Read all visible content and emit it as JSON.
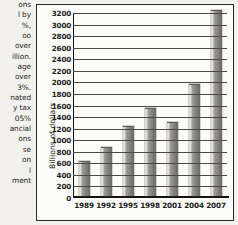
{
  "page": {
    "text_column": [
      "ons",
      "l by",
      "%,",
      "oo",
      "over",
      "illion.",
      "age",
      "over",
      "3%.",
      "nated",
      "y tax",
      "05%",
      "ancial",
      "ons",
      "se",
      "on",
      "l",
      "ment"
    ]
  },
  "chart_data": {
    "type": "bar",
    "title": "",
    "xlabel": "",
    "ylabel": "Billions of dollars",
    "categories": [
      "1989",
      "1992",
      "1995",
      "1998",
      "2001",
      "2004",
      "2007"
    ],
    "values": [
      600,
      830,
      1200,
      1510,
      1270,
      1920,
      3210
    ],
    "ylim": [
      0,
      3200
    ],
    "ytick_step": 200,
    "yticks": [
      "3200",
      "3000",
      "2800",
      "2600",
      "2400",
      "2200",
      "2000",
      "1800",
      "1600",
      "1400",
      "1200",
      "1000",
      "800",
      "600",
      "400",
      "200",
      "0"
    ],
    "grid": true,
    "legend": "none",
    "bar_color": "#8a8986",
    "axis_color": "#141312"
  }
}
